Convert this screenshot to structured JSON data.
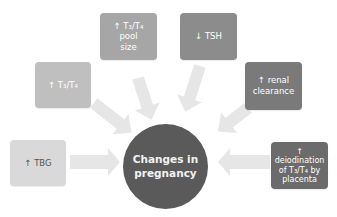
{
  "diagram": {
    "title": "Changes in pregnancy",
    "center": {
      "line1": "Changes in",
      "line2": "pregnancy",
      "color": "#5a5a5a"
    },
    "nodes": [
      {
        "id": "tbg",
        "line1": "↑ TBG",
        "line2": "",
        "line3": "",
        "line4": "",
        "color": "#d9d9d9",
        "text_color": "#555555"
      },
      {
        "id": "t3t4",
        "line1": "↑ T₃/T₄",
        "line2": "",
        "line3": "",
        "line4": "",
        "color": "#bfbfbf",
        "text_color": "#ffffff"
      },
      {
        "id": "pool-size",
        "line1": "↑ T₃/T₄ pool",
        "line2": "size",
        "line3": "",
        "line4": "",
        "color": "#a6a6a6",
        "text_color": "#ffffff"
      },
      {
        "id": "tsh",
        "line1": "↓ TSH",
        "line2": "",
        "line3": "",
        "line4": "",
        "color": "#8c8c8c",
        "text_color": "#ffffff"
      },
      {
        "id": "renal",
        "line1": "↑ renal",
        "line2": "clearance",
        "line3": "",
        "line4": "",
        "color": "#7a7a7a",
        "text_color": "#ffffff"
      },
      {
        "id": "deiodination",
        "line1": "↑",
        "line2": "deiodination",
        "line3": "of T₃/T₄ by",
        "line4": "placenta",
        "color": "#6b6b6b",
        "text_color": "#ffffff"
      }
    ],
    "arrow_color": "#e6e6e6"
  }
}
